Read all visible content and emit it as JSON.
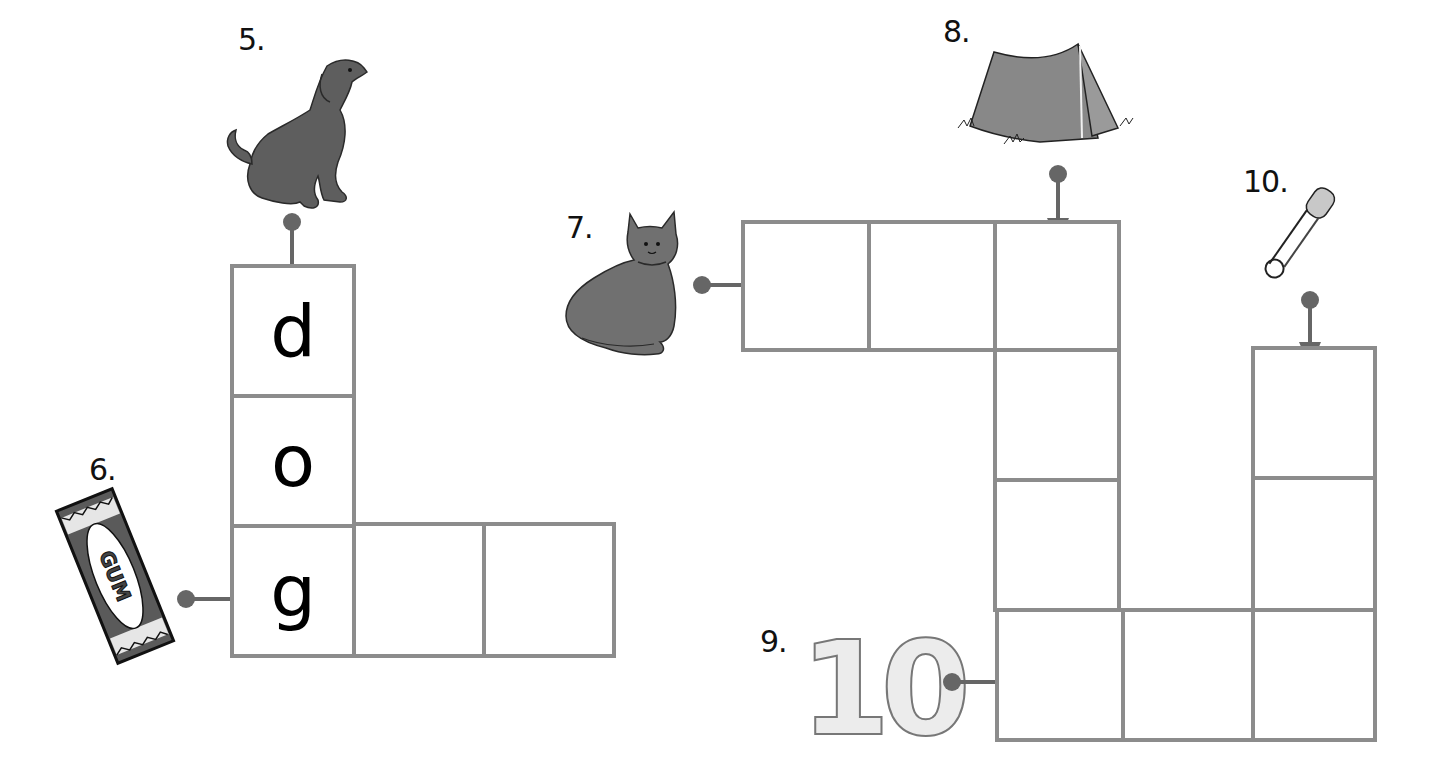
{
  "worksheet": {
    "type": "picture crossword",
    "colors": {
      "grid_line": "#8c8c8c",
      "arrow": "#666666",
      "picture": "#6f6f6f"
    }
  },
  "clues": [
    {
      "number": "5.",
      "picture": "dog",
      "direction": "down",
      "answer_shown": [
        "d",
        "o",
        "g"
      ]
    },
    {
      "number": "6.",
      "picture": "gum",
      "picture_text": "GUM",
      "direction": "across",
      "answer_shown": [
        "g",
        "",
        ""
      ]
    },
    {
      "number": "7.",
      "picture": "cat",
      "direction": "across",
      "answer_shown": [
        "",
        "",
        ""
      ]
    },
    {
      "number": "8.",
      "picture": "tent",
      "direction": "down",
      "answer_shown": [
        "",
        "",
        "",
        ""
      ]
    },
    {
      "number": "9.",
      "picture": "ten",
      "picture_text": "10",
      "direction": "across",
      "answer_shown": [
        "",
        "",
        ""
      ]
    },
    {
      "number": "10.",
      "picture": "safety-pin",
      "direction": "down",
      "answer_shown": [
        "",
        "",
        ""
      ]
    }
  ],
  "grid": {
    "left_cells": {
      "c1": "d",
      "c2": "o",
      "c3": "g",
      "c4": "",
      "c5": ""
    }
  }
}
